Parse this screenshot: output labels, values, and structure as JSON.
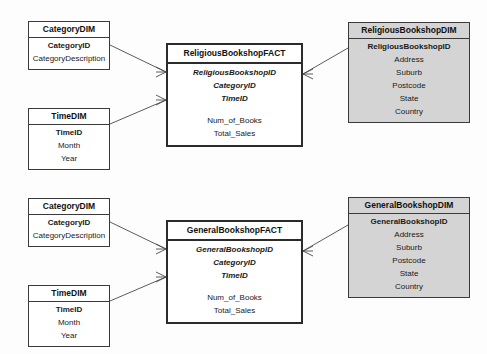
{
  "diagram": {
    "type": "star-schema-erd",
    "notation": "crows-foot",
    "colors": {
      "background": "#fdfdfd",
      "entity_fill": "#ffffff",
      "dimension_fill": "#d4d4d4",
      "border": "#3a3a3a",
      "fact_border": "#2b2b2b",
      "text": "#1a1a1a"
    },
    "clusters": [
      {
        "id": "religious",
        "category_dim": {
          "title": "CategoryDIM",
          "attributes": [
            {
              "name": "CategoryID",
              "role": "key"
            },
            {
              "name": "CategoryDescription",
              "role": "plain"
            }
          ]
        },
        "time_dim": {
          "title": "TimeDIM",
          "attributes": [
            {
              "name": "TimeID",
              "role": "key"
            },
            {
              "name": "Month",
              "role": "plain"
            },
            {
              "name": "Year",
              "role": "plain"
            }
          ]
        },
        "fact": {
          "title": "ReligiousBookshopFACT",
          "foreign_keys": [
            {
              "name": "ReligiousBookshopID"
            },
            {
              "name": "CategoryID"
            },
            {
              "name": "TimeID"
            }
          ],
          "measures": [
            {
              "name": "Num_of_Books"
            },
            {
              "name": "Total_Sales"
            }
          ]
        },
        "bookshop_dim": {
          "title": "ReligiousBookshopDIM",
          "attributes": [
            {
              "name": "ReligiousBookshopID",
              "role": "key"
            },
            {
              "name": "Address",
              "role": "plain"
            },
            {
              "name": "Suburb",
              "role": "plain"
            },
            {
              "name": "Postcode",
              "role": "plain"
            },
            {
              "name": "State",
              "role": "plain"
            },
            {
              "name": "Country",
              "role": "plain"
            }
          ]
        }
      },
      {
        "id": "general",
        "category_dim": {
          "title": "CategoryDIM",
          "attributes": [
            {
              "name": "CategoryID",
              "role": "key"
            },
            {
              "name": "CategoryDescription",
              "role": "plain"
            }
          ]
        },
        "time_dim": {
          "title": "TimeDIM",
          "attributes": [
            {
              "name": "TimeID",
              "role": "key"
            },
            {
              "name": "Month",
              "role": "plain"
            },
            {
              "name": "Year",
              "role": "plain"
            }
          ]
        },
        "fact": {
          "title": "GeneralBookshopFACT",
          "foreign_keys": [
            {
              "name": "GeneralBookshopID"
            },
            {
              "name": "CategoryID"
            },
            {
              "name": "TimeID"
            }
          ],
          "measures": [
            {
              "name": "Num_of_Books"
            },
            {
              "name": "Total_Sales"
            }
          ]
        },
        "bookshop_dim": {
          "title": "GeneralBookshopDIM",
          "attributes": [
            {
              "name": "GeneralBookshopID",
              "role": "key"
            },
            {
              "name": "Address",
              "role": "plain"
            },
            {
              "name": "Suburb",
              "role": "plain"
            },
            {
              "name": "Postcode",
              "role": "plain"
            },
            {
              "name": "State",
              "role": "plain"
            },
            {
              "name": "Country",
              "role": "plain"
            }
          ]
        }
      }
    ]
  }
}
